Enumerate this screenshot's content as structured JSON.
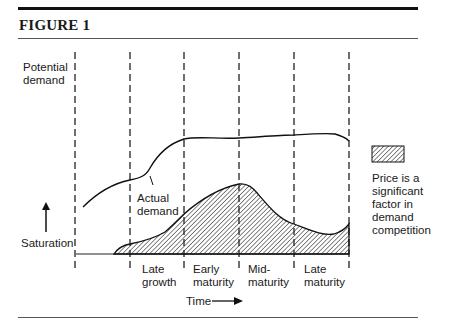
{
  "figure": {
    "title": "FIGURE 1"
  },
  "axis": {
    "top_label_line1": "Potential",
    "top_label_line2": "demand",
    "bottom_label": "Saturation",
    "time_label": "Time"
  },
  "curve_labels": {
    "actual_line1": "Actual",
    "actual_line2": "demand"
  },
  "stages": [
    {
      "line1": "Late",
      "line2": "growth"
    },
    {
      "line1": "Early",
      "line2": "maturity"
    },
    {
      "line1": "Mid-",
      "line2": "maturity"
    },
    {
      "line1": "Late",
      "line2": "maturity"
    }
  ],
  "legend": {
    "line1": "Price is a",
    "line2": "significant",
    "line3": "factor in",
    "line4": "demand",
    "line5": "competition"
  },
  "colors": {
    "ink": "#1a1a1a",
    "rule": "#555555"
  }
}
